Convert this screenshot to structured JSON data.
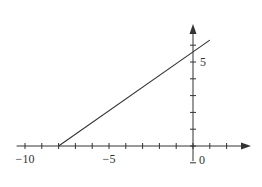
{
  "chart_data": {
    "type": "line",
    "title": "",
    "xlabel": "",
    "ylabel": "",
    "xlim": [
      -10.5,
      3.2
    ],
    "ylim": [
      -0.9,
      7.2
    ],
    "x_ticks": [
      -10,
      -9,
      -8,
      -7,
      -6,
      -5,
      -4,
      -3,
      -2,
      -1,
      0,
      1,
      2
    ],
    "y_ticks": [
      -1,
      0,
      1,
      2,
      3,
      4,
      5,
      6
    ],
    "x_tick_labels": [
      {
        "value": -10,
        "label": "−10"
      },
      {
        "value": -5,
        "label": "−5"
      },
      {
        "value": 0,
        "label": "0"
      }
    ],
    "y_tick_labels": [
      {
        "value": 5,
        "label": "5"
      }
    ],
    "grid": false,
    "legend": null,
    "series": [
      {
        "name": "line",
        "x": [
          -8,
          1
        ],
        "y": [
          0,
          6.3
        ],
        "color": "#333333"
      }
    ]
  },
  "colors": {
    "axis": "#333333",
    "line": "#333333"
  }
}
